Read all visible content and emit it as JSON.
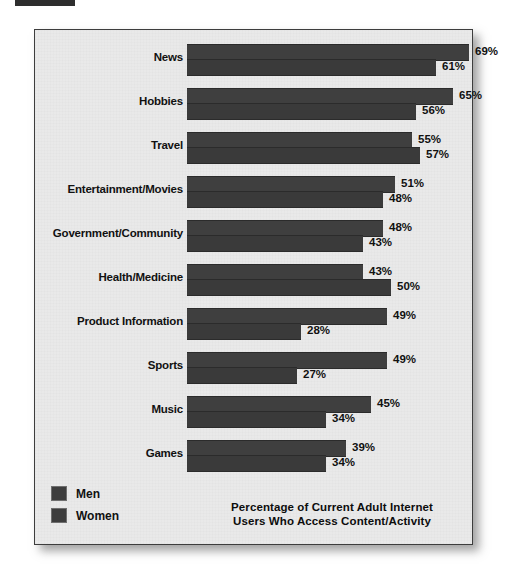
{
  "chart_data": {
    "type": "bar",
    "orientation": "horizontal",
    "title_lines": [
      "Percentage of Current Adult Internet",
      "Users Who Access Content/Activity"
    ],
    "xlabel": "",
    "ylabel": "",
    "xlim": [
      0,
      69
    ],
    "grid": false,
    "legend_position": "bottom-left",
    "value_suffix": "%",
    "categories": [
      "News",
      "Hobbies",
      "Travel",
      "Entertainment/Movies",
      "Government/Community",
      "Health/Medicine",
      "Product Information",
      "Sports",
      "Music",
      "Games"
    ],
    "series": [
      {
        "name": "Men",
        "color": "#3f3f3f",
        "values": [
          69,
          65,
          55,
          51,
          48,
          43,
          49,
          49,
          45,
          39
        ],
        "labels": [
          "69%",
          "65%",
          "55%",
          "51%",
          "48%",
          "43%",
          "49%",
          "49%",
          "45%",
          "39%"
        ]
      },
      {
        "name": "Women",
        "color": "#3a3a3a",
        "values": [
          61,
          56,
          57,
          48,
          43,
          50,
          28,
          27,
          34,
          34
        ],
        "labels": [
          "61%",
          "56%",
          "57%",
          "48%",
          "43%",
          "50%",
          "28%",
          "27%",
          "34%",
          "34%"
        ]
      }
    ]
  },
  "legend": {
    "items": [
      {
        "label": "Men",
        "color": "#3d3d3d"
      },
      {
        "label": "Women",
        "color": "#3d3d3d"
      }
    ]
  },
  "panel": {
    "background_color": "#e9e9e9",
    "border_color": "#3d3d3d"
  }
}
